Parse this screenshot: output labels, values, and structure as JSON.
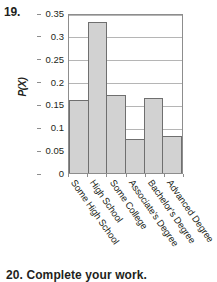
{
  "problem": {
    "number": "19."
  },
  "next_problem_partial": "20. Complete your work.",
  "chart_data": {
    "type": "bar",
    "title": "",
    "xlabel": "",
    "ylabel": "P(X)",
    "categories": [
      "Some High School",
      "High School",
      "Some College",
      "Associate's Degree",
      "Bachelor's Degree",
      "Advanced Degree"
    ],
    "values": [
      0.16,
      0.33,
      0.17,
      0.075,
      0.165,
      0.082
    ],
    "ylim": [
      0,
      0.35
    ],
    "yticks": [
      0,
      0.05,
      0.1,
      0.15,
      0.2,
      0.25,
      0.3,
      0.35
    ],
    "ytick_labels": [
      "0",
      "0.05",
      "0.1",
      "0.15",
      "0.2",
      "0.25",
      "0.3",
      "0.35"
    ],
    "grid": true,
    "legend": "none",
    "bar_fill": "#d2d2d2",
    "bar_border": "#6f6f6f",
    "frame_color": "#8d8d8d",
    "grid_color": "#b5b5b5"
  }
}
